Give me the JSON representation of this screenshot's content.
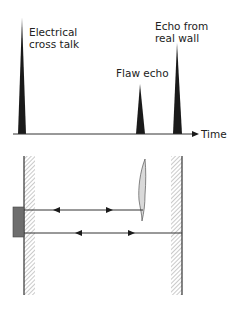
{
  "top_panel": {
    "labels": {
      "cross_talk_line1": "Electrical",
      "cross_talk_line2": "cross talk",
      "flaw_echo": "Flaw echo",
      "wall_echo_line1": "Echo from",
      "wall_echo_line2": "real wall",
      "time_axis": "Time"
    },
    "peaks": [
      {
        "name": "Electrical cross talk",
        "x": 22,
        "top_y": 18
      },
      {
        "name": "Flaw echo",
        "x": 140,
        "top_y": 84
      },
      {
        "name": "Echo from real wall",
        "x": 177,
        "top_y": 43
      }
    ]
  },
  "bottom_panel": {
    "components": [
      "left wall",
      "transducer",
      "flaw",
      "right wall",
      "flaw echo path",
      "wall echo path"
    ]
  },
  "colors": {
    "peak_fill": "#1a1a1a",
    "line": "#333333",
    "transducer": "#6e6e6e",
    "flaw_fill": "#d9d9d9"
  }
}
